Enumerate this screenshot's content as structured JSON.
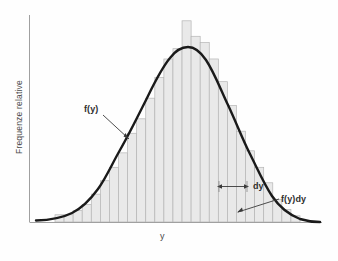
{
  "figure": {
    "kind": "histogram-with-density-curve",
    "background_color": "#fefefe",
    "axis_color": "#9a9a9a",
    "bar_fill_color": "#e9e9e9",
    "bar_edge_color": "#b5b5b5",
    "curve_color": "#1a1a1a",
    "annotation_color": "#2f2f2f"
  },
  "axes": {
    "y_title": "Frequenze relative",
    "x_title": "y"
  },
  "annotations": {
    "curve_label": "f(y)",
    "interval_label": "dy",
    "area_label": "f(y)dy"
  },
  "chart_data": {
    "type": "bar",
    "title": "",
    "subtitle": "",
    "xlabel": "y",
    "ylabel": "Frequenze relative",
    "grid": false,
    "legend": null,
    "xlim": [
      0,
      28
    ],
    "ylim": [
      0,
      1
    ],
    "tick_labels": {
      "x": [],
      "y": []
    },
    "bar_count": 27,
    "categories": [
      "1",
      "2",
      "3",
      "4",
      "5",
      "6",
      "7",
      "8",
      "9",
      "10",
      "11",
      "12",
      "13",
      "14",
      "15",
      "16",
      "17",
      "18",
      "19",
      "20",
      "21",
      "22",
      "23",
      "24",
      "25",
      "26",
      "27"
    ],
    "values": [
      0.035,
      0.035,
      0.055,
      0.085,
      0.135,
      0.2,
      0.265,
      0.335,
      0.43,
      0.5,
      0.6,
      0.7,
      0.79,
      0.84,
      0.975,
      0.9,
      0.87,
      0.79,
      0.68,
      0.565,
      0.44,
      0.345,
      0.265,
      0.19,
      0.11,
      0.06,
      0.03
    ],
    "series": [
      {
        "name": "Frequenze relative (istogramma)",
        "type": "bar",
        "values": [
          0.035,
          0.035,
          0.055,
          0.085,
          0.135,
          0.2,
          0.265,
          0.335,
          0.43,
          0.5,
          0.6,
          0.7,
          0.79,
          0.84,
          0.975,
          0.9,
          0.87,
          0.79,
          0.68,
          0.565,
          0.44,
          0.345,
          0.265,
          0.19,
          0.11,
          0.06,
          0.03
        ]
      },
      {
        "name": "f(y) densita normale",
        "type": "line",
        "x": [
          0.0,
          1.0,
          2.0,
          3.0,
          4.0,
          5.0,
          6.0,
          7.0,
          8.0,
          9.0,
          10.0,
          11.0,
          12.0,
          13.0,
          14.0,
          15.0,
          16.0,
          17.0,
          18.0,
          19.0,
          20.0,
          21.0,
          22.0,
          23.0,
          24.0,
          25.0,
          26.0,
          27.0,
          28.0
        ],
        "values": [
          0.005,
          0.01,
          0.02,
          0.037,
          0.063,
          0.101,
          0.154,
          0.222,
          0.305,
          0.4,
          0.502,
          0.603,
          0.698,
          0.778,
          0.838,
          0.872,
          0.878,
          0.855,
          0.804,
          0.729,
          0.638,
          0.537,
          0.435,
          0.337,
          0.25,
          0.177,
          0.119,
          0.077,
          0.047
        ]
      }
    ]
  }
}
